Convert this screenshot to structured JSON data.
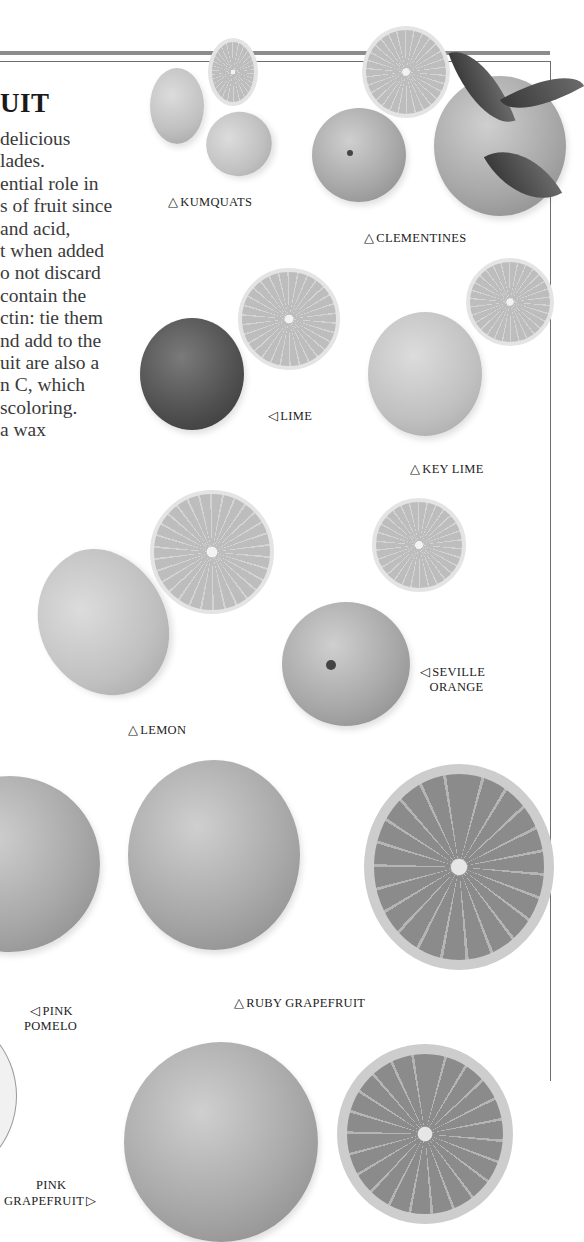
{
  "page": {
    "heading": "UIT",
    "body_lines": [
      "delicious",
      "lades.",
      "ential role in",
      "s of fruit since",
      " and acid,",
      "t when added",
      "o not discard",
      "contain the",
      "ctin: tie them",
      "nd add to the",
      "uit are also a",
      "n C, which",
      "scoloring.",
      "a wax"
    ]
  },
  "labels": {
    "kumquats": {
      "arrow": "△",
      "text": "KUMQUATS"
    },
    "clementines": {
      "arrow": "△",
      "text": "CLEMENTINES"
    },
    "lime": {
      "arrow": "◁",
      "text": "LIME"
    },
    "key_lime": {
      "arrow": "△",
      "text": "KEY LIME"
    },
    "lemon": {
      "arrow": "△",
      "text": "LEMON"
    },
    "seville_orange": {
      "arrow": "◁",
      "line1": "SEVILLE",
      "line2": "ORANGE"
    },
    "ruby_grapefruit": {
      "arrow": "△",
      "text": "RUBY GRAPEFRUIT"
    },
    "pink_pomelo": {
      "arrow": "◁",
      "line1": "PINK",
      "line2": "POMELO"
    },
    "pink_grapefruit": {
      "arrow": "▷",
      "line1": "PINK",
      "line2": "GRAPEFRUIT"
    }
  },
  "colors": {
    "rule": "#8c8c8c",
    "text": "#3a3a3a",
    "background": "#ffffff"
  }
}
